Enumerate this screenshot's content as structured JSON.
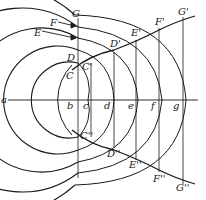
{
  "diagram": {
    "type": "geometric-construction",
    "stroke_color": "#1a1a1a",
    "background": "#ffffff",
    "axis_labels": {
      "a": "a",
      "b": "b",
      "c": "c",
      "d": "d",
      "e": "e",
      "f": "f",
      "g": "g"
    },
    "left_labels": {
      "C": "C",
      "D": "D",
      "E": "E",
      "F": "F",
      "G": "G"
    },
    "upper_curve_labels": {
      "C1": "C'",
      "D1": "D'",
      "E1": "E'",
      "F1": "F'",
      "G1": "G'"
    },
    "lower_curve_labels": {
      "C2": "C''",
      "D2": "D''",
      "E2": "E''",
      "F2": "F''",
      "G2": "G''"
    }
  }
}
